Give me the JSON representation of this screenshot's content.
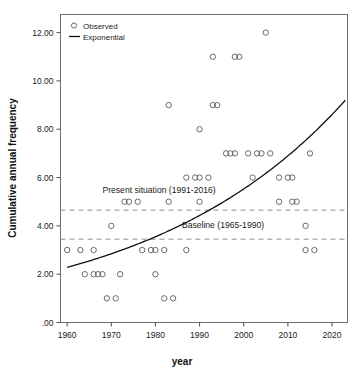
{
  "chart_data": {
    "type": "scatter",
    "title": "",
    "xlabel": "year",
    "ylabel": "Cumulative annual frequency",
    "xlim": [
      1958.5,
      2023.5
    ],
    "ylim": [
      0,
      12.75
    ],
    "grid": false,
    "legend_position": "top-left",
    "xticks": [
      1960,
      1970,
      1980,
      1990,
      2000,
      2010,
      2020
    ],
    "xtick_labels": [
      "1960",
      "1970",
      "1980",
      "1990",
      "2000",
      "2010",
      "2020"
    ],
    "yticks": [
      0,
      2,
      4,
      6,
      8,
      10,
      12
    ],
    "ytick_labels": [
      ".00",
      "2.00",
      "4.00",
      "6.00",
      "8.00",
      "10.00",
      "12.00"
    ],
    "series": [
      {
        "name": "Observed",
        "type": "scatter",
        "marker": "open-circle",
        "color": "#5a5a5a",
        "points": [
          [
            1960,
            3
          ],
          [
            1963,
            3
          ],
          [
            1966,
            3
          ],
          [
            1964,
            2
          ],
          [
            1966,
            2
          ],
          [
            1967,
            2
          ],
          [
            1968,
            2
          ],
          [
            1972,
            2
          ],
          [
            1969,
            1
          ],
          [
            1971,
            1
          ],
          [
            1970,
            4
          ],
          [
            1973,
            5
          ],
          [
            1974,
            5
          ],
          [
            1976,
            5
          ],
          [
            1977,
            3
          ],
          [
            1979,
            3
          ],
          [
            1980,
            3
          ],
          [
            1982,
            3
          ],
          [
            1980,
            2
          ],
          [
            1982,
            1
          ],
          [
            1984,
            1
          ],
          [
            1983,
            5
          ],
          [
            1983,
            9
          ],
          [
            1987,
            3
          ],
          [
            1987,
            6
          ],
          [
            1989,
            6
          ],
          [
            1990,
            6
          ],
          [
            1992,
            6
          ],
          [
            1990,
            8
          ],
          [
            1990,
            5
          ],
          [
            1993,
            11
          ],
          [
            1993,
            9
          ],
          [
            1994,
            9
          ],
          [
            1996,
            7
          ],
          [
            1997,
            7
          ],
          [
            1998,
            7
          ],
          [
            1998,
            11
          ],
          [
            1999,
            11
          ],
          [
            2001,
            7
          ],
          [
            2003,
            7
          ],
          [
            2004,
            7
          ],
          [
            2006,
            7
          ],
          [
            2002,
            6
          ],
          [
            2005,
            12
          ],
          [
            2008,
            6
          ],
          [
            2010,
            6
          ],
          [
            2011,
            6
          ],
          [
            2008,
            5
          ],
          [
            2011,
            5
          ],
          [
            2012,
            5
          ],
          [
            2014,
            4
          ],
          [
            2014,
            3
          ],
          [
            2016,
            3
          ],
          [
            2015,
            7
          ]
        ]
      },
      {
        "name": "Exponential",
        "type": "line",
        "color": "#111111",
        "description": "Exponential trend fit rising from about 2.28 in 1960 to about 9.2 in 2023",
        "y_start": 2.28,
        "y_end": 9.2,
        "x_start": 1960,
        "x_end": 2023
      }
    ],
    "reference_lines": [
      {
        "label": "Present situation (1991-2016)",
        "value": 4.65,
        "style": "dashed",
        "color": "#8e8e8e",
        "label_x": 1968,
        "label_y": 5.35
      },
      {
        "label": "Baseline (1965-1990)",
        "value": 3.45,
        "style": "dashed",
        "color": "#8e8e8e",
        "label_x": 1986,
        "label_y": 3.9
      }
    ]
  },
  "legend": {
    "entries": [
      {
        "label": "Observed",
        "marker": "open-circle"
      },
      {
        "label": "Exponential",
        "marker": "line"
      }
    ]
  }
}
